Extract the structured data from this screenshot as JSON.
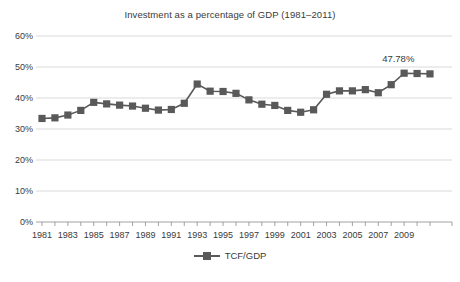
{
  "chart_data": {
    "type": "line",
    "title": "Investment as a percentage of GDP (1981–2011)",
    "xlabel": "",
    "ylabel": "",
    "ylim": [
      0,
      60
    ],
    "ytick_values": [
      0,
      10,
      20,
      30,
      40,
      50,
      60
    ],
    "ytick_labels": [
      "0%",
      "10%",
      "20%",
      "30%",
      "40%",
      "50%",
      "60%"
    ],
    "xlim": [
      1981,
      2011
    ],
    "xtick_labels": [
      "1981",
      "1983",
      "1985",
      "1987",
      "1989",
      "1991",
      "1993",
      "1995",
      "1997",
      "1999",
      "2001",
      "2003",
      "2005",
      "2007",
      "2009"
    ],
    "grid": true,
    "legend_position": "bottom",
    "marker": "square",
    "series_color": "#595959",
    "series": [
      {
        "name": "TCF/GDP",
        "x": [
          1981,
          1982,
          1983,
          1984,
          1985,
          1986,
          1987,
          1988,
          1989,
          1990,
          1991,
          1992,
          1993,
          1994,
          1995,
          1996,
          1997,
          1998,
          1999,
          2000,
          2001,
          2002,
          2003,
          2004,
          2005,
          2006,
          2007,
          2008,
          2009,
          2010,
          2011
        ],
        "values": [
          33.4,
          33.6,
          34.5,
          36.0,
          38.6,
          38.1,
          37.7,
          37.4,
          36.7,
          36.1,
          36.3,
          38.3,
          44.5,
          42.2,
          42.1,
          41.5,
          39.4,
          38.0,
          37.6,
          36.0,
          35.4,
          36.2,
          41.2,
          42.3,
          42.3,
          42.7,
          41.7,
          44.3,
          48.0,
          47.9,
          47.78
        ]
      }
    ],
    "annotations": [
      {
        "text": "47.78%",
        "x": 2009,
        "y": 52.5
      }
    ]
  },
  "legend": {
    "entries": [
      {
        "label": "TCF/GDP",
        "color": "#595959"
      }
    ]
  }
}
